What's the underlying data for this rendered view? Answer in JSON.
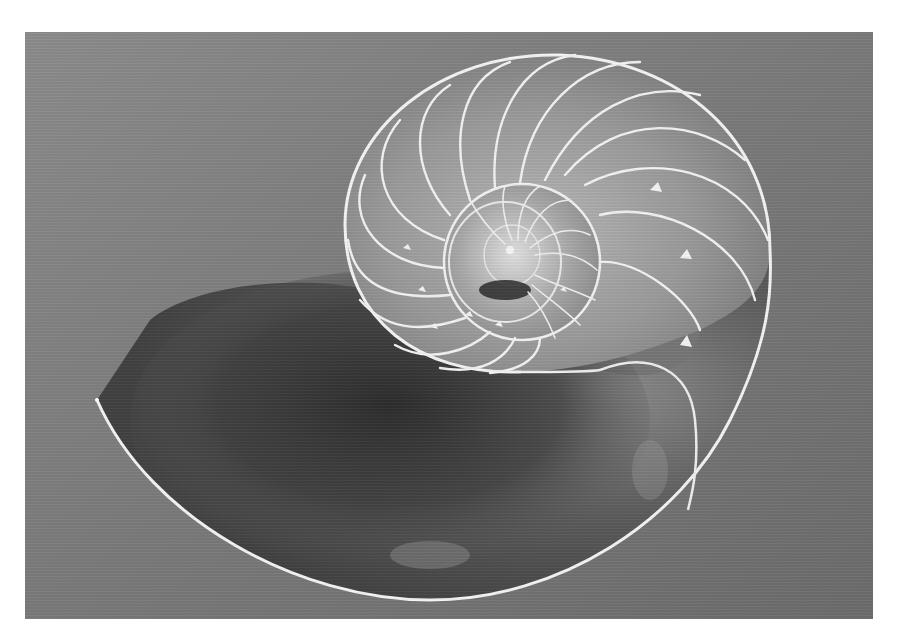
{
  "image": {
    "subject": "Nautilus shell cross-section",
    "style": "grayscale photograph",
    "frame": {
      "x": 25,
      "y": 32,
      "width": 848,
      "height": 587
    },
    "colors": {
      "page_background": "#ffffff",
      "backdrop_light": "#8a8a8a",
      "backdrop_mid": "#757575",
      "shadow_dark": "#2e2e2e",
      "shell_line": "#f4f4f4",
      "chamber_fill": "#9a9a9a"
    }
  }
}
